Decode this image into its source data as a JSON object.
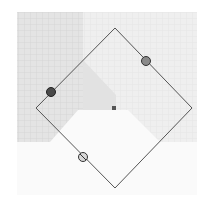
{
  "canvas": {
    "width": 210,
    "height": 206,
    "background_colors": {
      "page": "#ffffff",
      "grid_dark": "#dcdcdc",
      "grid_light": "#ececec",
      "region_mid": "#e6e6e6",
      "region_white": "#fbfbfb"
    }
  },
  "selection": {
    "shape": "rotated-square",
    "rotation_deg": 45,
    "stroke_color": "#555555",
    "vertices": {
      "top": [
        115,
        28
      ],
      "right": [
        192,
        108
      ],
      "bottom": [
        115,
        188
      ],
      "left": [
        36,
        108
      ]
    },
    "center": [
      114,
      108
    ]
  },
  "handles": [
    {
      "name": "rotate-handle",
      "x": 51,
      "y": 92,
      "fill": "#4a4a4a"
    },
    {
      "name": "scale-handle",
      "x": 146,
      "y": 61,
      "fill": "#8a8a8a"
    },
    {
      "name": "skew-handle",
      "x": 83,
      "y": 157,
      "fill": "#d8d8d8"
    }
  ]
}
